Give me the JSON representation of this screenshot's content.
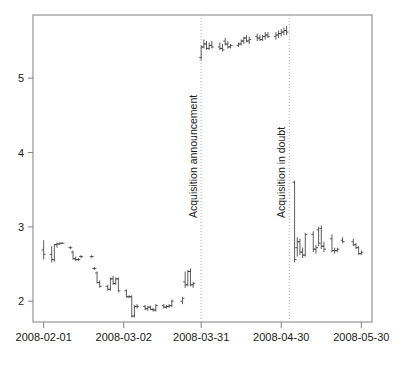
{
  "chart_data": {
    "type": "ohlc",
    "title": "",
    "subtitle": "",
    "xlabel": "",
    "ylabel": "",
    "grid": false,
    "legend": null,
    "axis": {
      "x_tick_labels": [
        "2008-02-01",
        "2008-03-02",
        "2008-03-31",
        "2008-04-30",
        "2008-05-30"
      ],
      "x_tick_dates": [
        "2008-02-01",
        "2008-03-02",
        "2008-03-31",
        "2008-04-30",
        "2008-05-30"
      ],
      "y_tick_labels": [
        "2",
        "3",
        "4",
        "5"
      ],
      "y_tick_values": [
        2,
        3,
        4,
        5
      ],
      "ylim": [
        1.72,
        5.85
      ],
      "xlim": [
        "2008-01-28",
        "2008-06-03"
      ]
    },
    "annotations": [
      {
        "label": "Acquisition announcement",
        "date": "2008-03-31",
        "orientation": "vertical",
        "line_style": "dotted"
      },
      {
        "label": "Acquisition in doubt",
        "date": "2008-05-03",
        "orientation": "vertical",
        "line_style": "dotted"
      }
    ],
    "series_name": "price",
    "bars": [
      {
        "t": "2008-02-01",
        "open": 2.69,
        "high": 2.82,
        "low": 2.56,
        "close": 2.63
      },
      {
        "t": "2008-02-04",
        "open": 2.63,
        "high": 2.74,
        "low": 2.52,
        "close": 2.56
      },
      {
        "t": "2008-02-05",
        "open": 2.56,
        "high": 2.77,
        "low": 2.53,
        "close": 2.76
      },
      {
        "t": "2008-02-06",
        "open": 2.76,
        "high": 2.79,
        "low": 2.72,
        "close": 2.77
      },
      {
        "t": "2008-02-07",
        "open": 2.77,
        "high": 2.79,
        "low": 2.76,
        "close": 2.78
      },
      {
        "t": "2008-02-08",
        "open": 2.78,
        "high": 2.79,
        "low": 2.77,
        "close": 2.78
      },
      {
        "t": "2008-02-11",
        "open": 2.72,
        "high": 2.74,
        "low": 2.7,
        "close": 2.72
      },
      {
        "t": "2008-02-12",
        "open": 2.66,
        "high": 2.68,
        "low": 2.56,
        "close": 2.57
      },
      {
        "t": "2008-02-13",
        "open": 2.57,
        "high": 2.6,
        "low": 2.54,
        "close": 2.56
      },
      {
        "t": "2008-02-14",
        "open": 2.56,
        "high": 2.58,
        "low": 2.54,
        "close": 2.56
      },
      {
        "t": "2008-02-15",
        "open": 2.6,
        "high": 2.62,
        "low": 2.58,
        "close": 2.6
      },
      {
        "t": "2008-02-19",
        "open": 2.6,
        "high": 2.62,
        "low": 2.58,
        "close": 2.6
      },
      {
        "t": "2008-02-20",
        "open": 2.44,
        "high": 2.46,
        "low": 2.42,
        "close": 2.44
      },
      {
        "t": "2008-02-21",
        "open": 2.38,
        "high": 2.4,
        "low": 2.24,
        "close": 2.25
      },
      {
        "t": "2008-02-22",
        "open": 2.25,
        "high": 2.28,
        "low": 2.18,
        "close": 2.2
      },
      {
        "t": "2008-02-25",
        "open": 2.2,
        "high": 2.22,
        "low": 2.14,
        "close": 2.16
      },
      {
        "t": "2008-02-26",
        "open": 2.16,
        "high": 2.32,
        "low": 2.14,
        "close": 2.3
      },
      {
        "t": "2008-02-27",
        "open": 2.3,
        "high": 2.34,
        "low": 2.22,
        "close": 2.24
      },
      {
        "t": "2008-02-28",
        "open": 2.24,
        "high": 2.32,
        "low": 2.22,
        "close": 2.3
      },
      {
        "t": "2008-02-29",
        "open": 2.3,
        "high": 2.32,
        "low": 2.12,
        "close": 2.14
      },
      {
        "t": "2008-03-03",
        "open": 2.14,
        "high": 2.16,
        "low": 2.05,
        "close": 2.06
      },
      {
        "t": "2008-03-04",
        "open": 2.06,
        "high": 2.08,
        "low": 2.04,
        "close": 2.06
      },
      {
        "t": "2008-03-05",
        "open": 2.06,
        "high": 2.08,
        "low": 1.78,
        "close": 1.8
      },
      {
        "t": "2008-03-06",
        "open": 1.8,
        "high": 1.95,
        "low": 1.78,
        "close": 1.93
      },
      {
        "t": "2008-03-07",
        "open": 1.93,
        "high": 1.96,
        "low": 1.9,
        "close": 1.93
      },
      {
        "t": "2008-03-10",
        "open": 1.93,
        "high": 1.95,
        "low": 1.88,
        "close": 1.9
      },
      {
        "t": "2008-03-11",
        "open": 1.9,
        "high": 1.93,
        "low": 1.87,
        "close": 1.92
      },
      {
        "t": "2008-03-12",
        "open": 1.92,
        "high": 1.94,
        "low": 1.88,
        "close": 1.89
      },
      {
        "t": "2008-03-13",
        "open": 1.89,
        "high": 1.91,
        "low": 1.86,
        "close": 1.88
      },
      {
        "t": "2008-03-14",
        "open": 1.88,
        "high": 1.96,
        "low": 1.86,
        "close": 1.94
      },
      {
        "t": "2008-03-17",
        "open": 1.94,
        "high": 1.96,
        "low": 1.9,
        "close": 1.92
      },
      {
        "t": "2008-03-18",
        "open": 1.92,
        "high": 1.95,
        "low": 1.9,
        "close": 1.93
      },
      {
        "t": "2008-03-19",
        "open": 1.93,
        "high": 1.96,
        "low": 1.91,
        "close": 1.94
      },
      {
        "t": "2008-03-20",
        "open": 1.94,
        "high": 2.02,
        "low": 1.92,
        "close": 2.0
      },
      {
        "t": "2008-03-24",
        "open": 2.0,
        "high": 2.06,
        "low": 1.96,
        "close": 2.04
      },
      {
        "t": "2008-03-25",
        "open": 2.26,
        "high": 2.4,
        "low": 2.18,
        "close": 2.22
      },
      {
        "t": "2008-03-26",
        "open": 2.22,
        "high": 2.42,
        "low": 2.2,
        "close": 2.4
      },
      {
        "t": "2008-03-27",
        "open": 2.4,
        "high": 2.44,
        "low": 2.2,
        "close": 2.22
      },
      {
        "t": "2008-03-28",
        "open": 2.22,
        "high": 2.26,
        "low": 2.18,
        "close": 2.24
      },
      {
        "t": "2008-03-31",
        "open": 5.28,
        "high": 5.44,
        "low": 5.24,
        "close": 5.42
      },
      {
        "t": "2008-04-01",
        "open": 5.42,
        "high": 5.52,
        "low": 5.4,
        "close": 5.46
      },
      {
        "t": "2008-04-02",
        "open": 5.46,
        "high": 5.5,
        "low": 5.38,
        "close": 5.4
      },
      {
        "t": "2008-04-03",
        "open": 5.4,
        "high": 5.48,
        "low": 5.38,
        "close": 5.44
      },
      {
        "t": "2008-04-04",
        "open": 5.44,
        "high": 5.5,
        "low": 5.4,
        "close": 5.42
      },
      {
        "t": "2008-04-07",
        "open": 5.42,
        "high": 5.48,
        "low": 5.38,
        "close": 5.4
      },
      {
        "t": "2008-04-08",
        "open": 5.4,
        "high": 5.46,
        "low": 5.36,
        "close": 5.38
      },
      {
        "t": "2008-04-09",
        "open": 5.5,
        "high": 5.54,
        "low": 5.44,
        "close": 5.46
      },
      {
        "t": "2008-04-10",
        "open": 5.46,
        "high": 5.5,
        "low": 5.4,
        "close": 5.42
      },
      {
        "t": "2008-04-11",
        "open": 5.42,
        "high": 5.46,
        "low": 5.4,
        "close": 5.44
      },
      {
        "t": "2008-04-14",
        "open": 5.44,
        "high": 5.48,
        "low": 5.42,
        "close": 5.46
      },
      {
        "t": "2008-04-15",
        "open": 5.46,
        "high": 5.52,
        "low": 5.44,
        "close": 5.5
      },
      {
        "t": "2008-04-16",
        "open": 5.5,
        "high": 5.56,
        "low": 5.46,
        "close": 5.54
      },
      {
        "t": "2008-04-17",
        "open": 5.54,
        "high": 5.58,
        "low": 5.48,
        "close": 5.5
      },
      {
        "t": "2008-04-18",
        "open": 5.5,
        "high": 5.56,
        "low": 5.46,
        "close": 5.52
      },
      {
        "t": "2008-04-21",
        "open": 5.56,
        "high": 5.6,
        "low": 5.5,
        "close": 5.54
      },
      {
        "t": "2008-04-22",
        "open": 5.54,
        "high": 5.58,
        "low": 5.5,
        "close": 5.52
      },
      {
        "t": "2008-04-23",
        "open": 5.52,
        "high": 5.58,
        "low": 5.5,
        "close": 5.56
      },
      {
        "t": "2008-04-24",
        "open": 5.56,
        "high": 5.62,
        "low": 5.52,
        "close": 5.58
      },
      {
        "t": "2008-04-25",
        "open": 5.58,
        "high": 5.62,
        "low": 5.54,
        "close": 5.56
      },
      {
        "t": "2008-04-28",
        "open": 5.56,
        "high": 5.62,
        "low": 5.52,
        "close": 5.58
      },
      {
        "t": "2008-04-29",
        "open": 5.58,
        "high": 5.64,
        "low": 5.54,
        "close": 5.6
      },
      {
        "t": "2008-04-30",
        "open": 5.6,
        "high": 5.66,
        "low": 5.56,
        "close": 5.62
      },
      {
        "t": "2008-05-01",
        "open": 5.62,
        "high": 5.68,
        "low": 5.58,
        "close": 5.64
      },
      {
        "t": "2008-05-02",
        "open": 5.64,
        "high": 5.7,
        "low": 5.58,
        "close": 5.62
      },
      {
        "t": "2008-05-05",
        "open": 3.6,
        "high": 3.62,
        "low": 2.52,
        "close": 2.56
      },
      {
        "t": "2008-05-06",
        "open": 2.72,
        "high": 2.86,
        "low": 2.6,
        "close": 2.8
      },
      {
        "t": "2008-05-07",
        "open": 2.8,
        "high": 2.84,
        "low": 2.62,
        "close": 2.66
      },
      {
        "t": "2008-05-08",
        "open": 2.66,
        "high": 2.72,
        "low": 2.58,
        "close": 2.62
      },
      {
        "t": "2008-05-09",
        "open": 2.62,
        "high": 2.92,
        "low": 2.6,
        "close": 2.9
      },
      {
        "t": "2008-05-12",
        "open": 2.9,
        "high": 2.94,
        "low": 2.66,
        "close": 2.7
      },
      {
        "t": "2008-05-13",
        "open": 2.7,
        "high": 2.76,
        "low": 2.64,
        "close": 2.72
      },
      {
        "t": "2008-05-14",
        "open": 2.96,
        "high": 3.0,
        "low": 2.74,
        "close": 2.78
      },
      {
        "t": "2008-05-15",
        "open": 2.98,
        "high": 3.02,
        "low": 2.7,
        "close": 2.74
      },
      {
        "t": "2008-05-16",
        "open": 2.74,
        "high": 2.8,
        "low": 2.66,
        "close": 2.7
      },
      {
        "t": "2008-05-19",
        "open": 2.84,
        "high": 2.9,
        "low": 2.66,
        "close": 2.68
      },
      {
        "t": "2008-05-20",
        "open": 2.68,
        "high": 2.72,
        "low": 2.64,
        "close": 2.68
      },
      {
        "t": "2008-05-21",
        "open": 2.68,
        "high": 2.72,
        "low": 2.66,
        "close": 2.7
      },
      {
        "t": "2008-05-23",
        "open": 2.82,
        "high": 2.86,
        "low": 2.78,
        "close": 2.8
      },
      {
        "t": "2008-05-27",
        "open": 2.8,
        "high": 2.84,
        "low": 2.74,
        "close": 2.76
      },
      {
        "t": "2008-05-28",
        "open": 2.76,
        "high": 2.78,
        "low": 2.7,
        "close": 2.72
      },
      {
        "t": "2008-05-29",
        "open": 2.72,
        "high": 2.74,
        "low": 2.62,
        "close": 2.64
      },
      {
        "t": "2008-05-30",
        "open": 2.64,
        "high": 2.68,
        "low": 2.62,
        "close": 2.66
      }
    ]
  },
  "style": {
    "background": "#ffffff",
    "frame_color": "#808080",
    "series_color": "#333333",
    "annotation_line_color": "#b0b0b0",
    "tick_label_color": "#1a1a1a"
  }
}
